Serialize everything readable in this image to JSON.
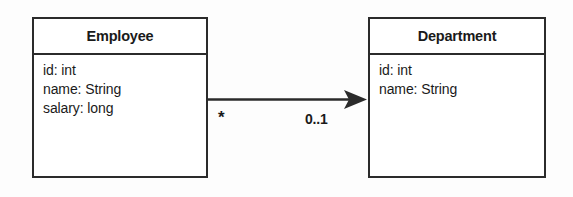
{
  "diagram": {
    "type": "uml-class-diagram",
    "background_color": "#fdfdfd",
    "line_color": "#2b2b2b",
    "text_color": "#1a1a1a",
    "classes": [
      {
        "name": "Employee",
        "attributes": [
          "id: int",
          "name: String",
          "salary: long"
        ]
      },
      {
        "name": "Department",
        "attributes": [
          "id: int",
          "name: String"
        ]
      }
    ],
    "association": {
      "source": "Employee",
      "target": "Department",
      "arrow": "open-directed-solid-filled",
      "source_multiplicity": "*",
      "target_multiplicity": "0..1"
    }
  }
}
